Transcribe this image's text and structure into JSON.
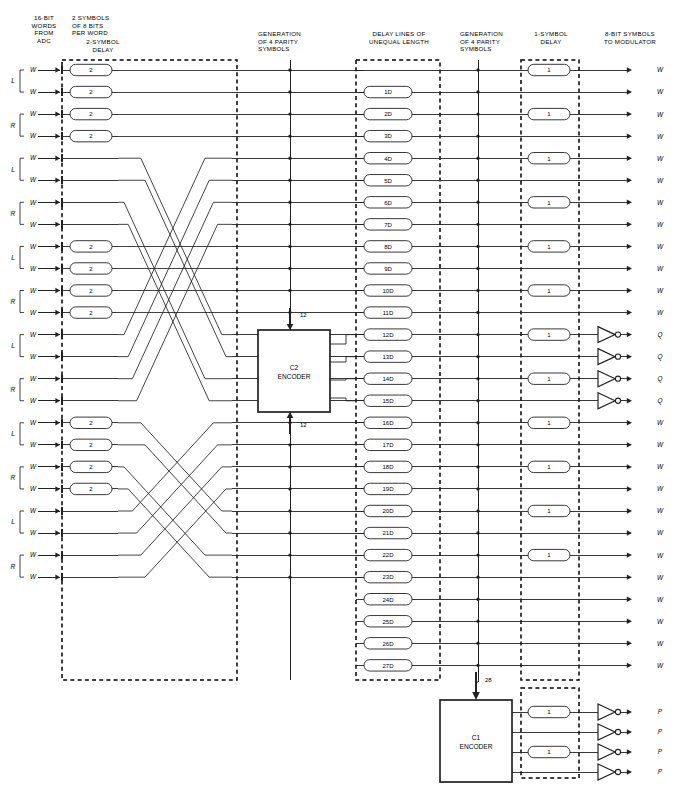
{
  "diagram": {
    "headers": {
      "source": "16-BIT\nWORDS\nFROM\nADC",
      "symbols": "2 SYMBOLS\nOF 8 BITS\nPER WORD",
      "two_symbol_delay": "2-SYMBOL\nDELAY",
      "parity_c2": "GENERATION\nOF 4 PARITY\nSYMBOLS",
      "delay_lines": "DELAY LINES OF\nUNEQUAL LENGTH",
      "parity_c1": "GENERATION\nOF 4 PARITY\nSYMBOLS",
      "one_symbol_delay": "1-SYMBOL\nDELAY",
      "outputs": "8-BIT SYMBOLS\nTO MODULATOR"
    },
    "channel_labels": [
      "L",
      "R",
      "L",
      "R",
      "L",
      "R",
      "L",
      "R",
      "L",
      "R",
      "L",
      "R"
    ],
    "input_label": "W",
    "input_count": 24,
    "two_delay_label": "2",
    "one_delay_label": "1",
    "two_delay_rows": [
      1,
      2,
      3,
      4,
      9,
      10,
      11,
      12,
      17,
      18,
      19,
      20
    ],
    "one_delay_rows": [
      1,
      3,
      5,
      7,
      9,
      11,
      13,
      15,
      17,
      19,
      21,
      23
    ],
    "delay_line_labels": [
      "",
      "1D",
      "2D",
      "3D",
      "4D",
      "5D",
      "6D",
      "7D",
      "8D",
      "9D",
      "10D",
      "11D",
      "12D",
      "13D",
      "14D",
      "15D",
      "16D",
      "17D",
      "18D",
      "19D",
      "20D",
      "21D",
      "22D",
      "23D",
      "24D",
      "25D",
      "26D",
      "27D"
    ],
    "encoders": [
      {
        "name": "c2-encoder",
        "line1": "C2",
        "line2": "ENCODER",
        "in_top": "12",
        "in_bottom": "12"
      },
      {
        "name": "c1-encoder",
        "line1": "C1",
        "line2": "ENCODER",
        "in_top": "28"
      }
    ],
    "bus_widths": {
      "c2_top": "12",
      "c2_bottom": "12",
      "c1_top": "28"
    },
    "output_labels_main": [
      "W",
      "W",
      "W",
      "W",
      "W",
      "W",
      "W",
      "W",
      "W",
      "W",
      "W",
      "W",
      "Q",
      "Q",
      "Q",
      "Q",
      "W",
      "W",
      "W",
      "W",
      "W",
      "W",
      "W",
      "W",
      "W",
      "W",
      "W",
      "W"
    ],
    "output_labels_c1": [
      "P",
      "P",
      "P",
      "P"
    ],
    "colors": {
      "line": "#222222",
      "dashed": "#000000",
      "text": "#000000",
      "background": "#ffffff"
    }
  }
}
